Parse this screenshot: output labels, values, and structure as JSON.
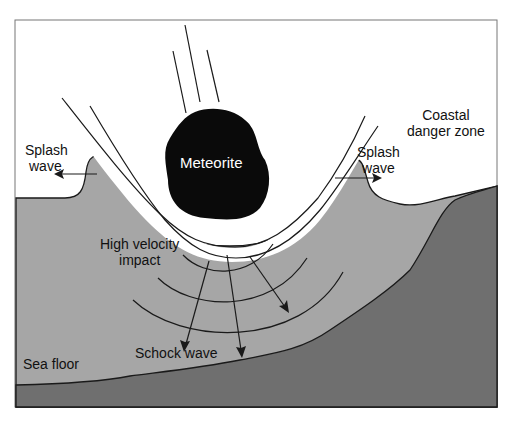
{
  "diagram": {
    "labels": {
      "meteorite": "Meteorite",
      "splash_wave_left_line1": "Splash",
      "splash_wave_left_line2": "wave",
      "splash_wave_right_line1": "Splash",
      "splash_wave_right_line2": "wave",
      "coastal_line1": "Coastal",
      "coastal_line2": "danger zone",
      "impact_line1": "High velocity",
      "impact_line2": "impact",
      "shock_wave": "Schock wave",
      "sea_floor": "Sea floor"
    },
    "colors": {
      "sky": "#ffffff",
      "water": "#a6a6a6",
      "land": "#6f6f6f",
      "meteorite": "#0a0a0a",
      "outline": "#1a1a1a"
    }
  }
}
